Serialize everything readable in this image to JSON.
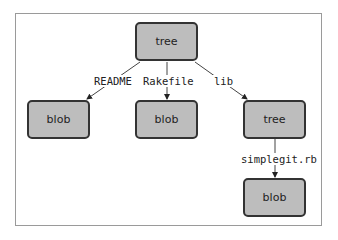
{
  "diagram": {
    "type": "tree",
    "nodes": [
      {
        "id": "root",
        "label": "tree"
      },
      {
        "id": "readme_blob",
        "label": "blob"
      },
      {
        "id": "rakefile_blob",
        "label": "blob"
      },
      {
        "id": "lib_tree",
        "label": "tree"
      },
      {
        "id": "simplegit_blob",
        "label": "blob"
      }
    ],
    "edges": [
      {
        "from": "root",
        "to": "readme_blob",
        "label": "README"
      },
      {
        "from": "root",
        "to": "rakefile_blob",
        "label": "Rakefile"
      },
      {
        "from": "root",
        "to": "lib_tree",
        "label": "lib"
      },
      {
        "from": "lib_tree",
        "to": "simplegit_blob",
        "label": "simplegit.rb"
      }
    ],
    "colors": {
      "node_fill": "#bdbdbd",
      "node_border": "#333333",
      "frame": "#9a9a9a"
    }
  }
}
